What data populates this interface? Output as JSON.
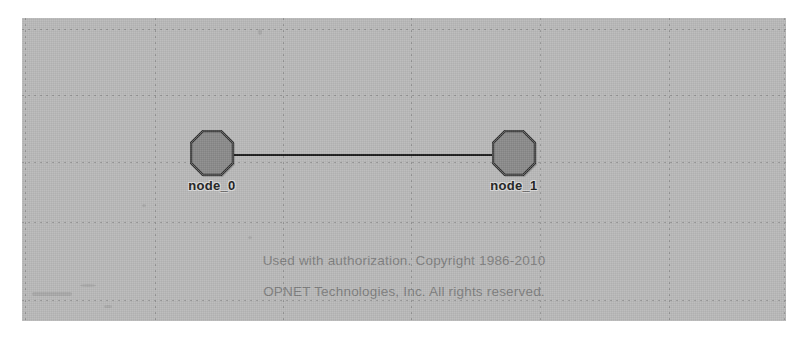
{
  "app": {
    "name": "OPNET Modeler Project Editor",
    "view": "network-topology"
  },
  "canvas": {
    "background_color": "#b9b9b9",
    "grid": {
      "style": "dotted",
      "color": "#8d8d8d",
      "vertical_positions": [
        3,
        133,
        261,
        389,
        518,
        647,
        762
      ],
      "horizontal_positions": [
        11,
        77,
        144,
        204,
        282
      ]
    }
  },
  "topology": {
    "nodes": [
      {
        "id": "node_0",
        "label": "node_0",
        "shape": "octagon",
        "fill_color": "#8a8a8a",
        "stroke_color": "#2b2b2b",
        "x": 168,
        "y": 112
      },
      {
        "id": "node_1",
        "label": "node_1",
        "shape": "octagon",
        "fill_color": "#8a8a8a",
        "stroke_color": "#2b2b2b",
        "x": 470,
        "y": 112
      }
    ],
    "links": [
      {
        "id": "link_0",
        "from": "node_0",
        "to": "node_1",
        "color": "#1c1c1c",
        "x": 212,
        "y": 136,
        "width": 258
      }
    ]
  },
  "copyright": {
    "line1": "Used with authorization. Copyright 1986-2010",
    "line2": "OPNET Technologies, Inc.  All rights reserved.",
    "color": "#7e7e7e"
  }
}
